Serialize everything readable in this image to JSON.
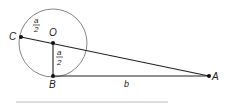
{
  "diagram": {
    "points": {
      "C": {
        "label": "C",
        "x": 21,
        "y": 37
      },
      "O": {
        "label": "O",
        "x": 53,
        "y": 43
      },
      "B": {
        "label": "B",
        "x": 53,
        "y": 76
      },
      "A": {
        "label": "A",
        "x": 209,
        "y": 76
      }
    },
    "circle": {
      "center": "O",
      "radius": 34
    },
    "segment_labels": {
      "CO": {
        "num": "a",
        "den": "2"
      },
      "OB": {
        "num": "a",
        "den": "2"
      },
      "BA": "b"
    },
    "colors": {
      "line": "#222222",
      "circle": "#777777",
      "baseline": "#bbbbbb"
    }
  }
}
